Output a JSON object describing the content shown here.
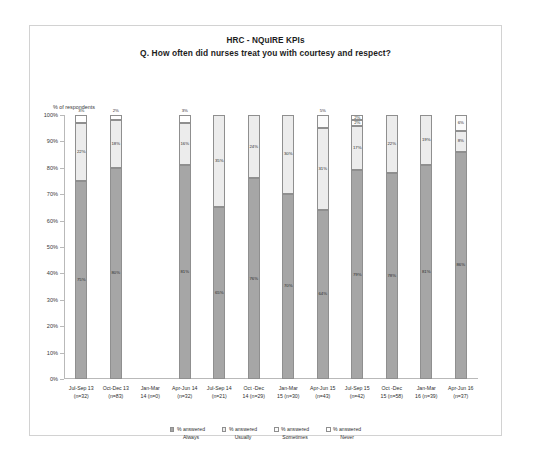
{
  "chart": {
    "title_line1": "HRC - NQuIRE KPIs",
    "title_line2": "Q. How often did nurses treat you with courtesy and respect?",
    "axis_title": "% of respondents"
  },
  "legend": {
    "items": [
      {
        "label_line1": "% answered",
        "label_line2": "Always",
        "key": "always",
        "color": "#a6a6a6"
      },
      {
        "label_line1": "% answered",
        "label_line2": "Usually",
        "key": "usually",
        "color": "#ececec"
      },
      {
        "label_line1": "% answered",
        "label_line2": "Sometimes",
        "key": "sometimes",
        "color": "#fbfbfb"
      },
      {
        "label_line1": "% answered",
        "label_line2": "Never",
        "key": "never",
        "color": "#ffffff"
      }
    ]
  },
  "chart_data": {
    "type": "bar",
    "subtype": "stacked-column-100",
    "xlabel": "",
    "ylabel": "% of respondents",
    "ylim": [
      0,
      100
    ],
    "ytick_labels": [
      "0%",
      "10%",
      "20%",
      "30%",
      "40%",
      "50%",
      "60%",
      "70%",
      "80%",
      "90%",
      "100%"
    ],
    "yticks": [
      0,
      10,
      20,
      30,
      40,
      50,
      60,
      70,
      80,
      90,
      100
    ],
    "grid": false,
    "legend_position": "bottom",
    "categories": [
      "Jul-Sep 13 (n=32)",
      "Oct-Dec 13 (n=83)",
      "Jan-Mar 14 (n=0)",
      "Apr-Jun 14 (n=32)",
      "Jul-Sep 14 (n=21)",
      "Oct -Dec 14 (n=29)",
      "Jan-Mar 15 (n=30)",
      "Apr-Jun 15 (n=43)",
      "Jul-Sep 15 (n=42)",
      "Oct -Dec 15 (n=58)",
      "Jan-Mar 16 (n=39)",
      "Apr-Jun 16 (n=37)"
    ],
    "category_labels": [
      [
        "Jul-Sep 13",
        "(n=32)"
      ],
      [
        "Oct-Dec 13",
        "(n=83)"
      ],
      [
        "Jan-Mar",
        "14 (n=0)"
      ],
      [
        "Apr-Jun 14",
        "(n=32)"
      ],
      [
        "Jul-Sep 14",
        "(n=21)"
      ],
      [
        "Oct -Dec",
        "14 (n=29)"
      ],
      [
        "Jan-Mar",
        "15 (n=30)"
      ],
      [
        "Apr-Jun 15",
        "(n=43)"
      ],
      [
        "Jul-Sep 15",
        "(n=42)"
      ],
      [
        "Oct -Dec",
        "15 (n=58)"
      ],
      [
        "Jan-Mar",
        "16 (n=39)"
      ],
      [
        "Apr-Jun 16",
        "(n=37)"
      ]
    ],
    "series": [
      {
        "name": "% answered Always",
        "key": "always",
        "values": [
          75,
          80,
          0,
          81,
          65,
          76,
          70,
          64,
          79,
          78,
          81,
          86
        ]
      },
      {
        "name": "% answered Usually",
        "key": "usually",
        "values": [
          22,
          18,
          0,
          16,
          35,
          24,
          30,
          31,
          17,
          22,
          19,
          8
        ]
      },
      {
        "name": "% answered Sometimes",
        "key": "sometimes",
        "values": [
          0,
          0,
          0,
          0,
          0,
          0,
          0,
          5,
          2,
          0,
          0,
          6
        ]
      },
      {
        "name": "% answered Never",
        "key": "never",
        "values": [
          3,
          2,
          0,
          3,
          0,
          0,
          0,
          0,
          2,
          0,
          0,
          0
        ]
      }
    ],
    "bars": [
      {
        "category": "Jul-Sep 13 (n=32)",
        "segments": [
          {
            "key": "always",
            "value": 75,
            "label": "75%",
            "label_placement": "inside"
          },
          {
            "key": "usually",
            "value": 22,
            "label": "22%",
            "label_placement": "inside"
          },
          {
            "key": "never",
            "value": 3,
            "label": "3%",
            "label_placement": "above"
          }
        ]
      },
      {
        "category": "Oct-Dec 13 (n=83)",
        "segments": [
          {
            "key": "always",
            "value": 80,
            "label": "80%",
            "label_placement": "inside"
          },
          {
            "key": "usually",
            "value": 18,
            "label": "18%",
            "label_placement": "inside"
          },
          {
            "key": "never",
            "value": 2,
            "label": "2%",
            "label_placement": "above"
          }
        ]
      },
      {
        "category": "Jan-Mar 14 (n=0)",
        "segments": []
      },
      {
        "category": "Apr-Jun 14 (n=32)",
        "segments": [
          {
            "key": "always",
            "value": 81,
            "label": "81%",
            "label_placement": "inside"
          },
          {
            "key": "usually",
            "value": 16,
            "label": "16%",
            "label_placement": "inside"
          },
          {
            "key": "never",
            "value": 3,
            "label": "3%",
            "label_placement": "above"
          }
        ]
      },
      {
        "category": "Jul-Sep 14 (n=21)",
        "segments": [
          {
            "key": "always",
            "value": 65,
            "label": "65%",
            "label_placement": "inside"
          },
          {
            "key": "usually",
            "value": 35,
            "label": "35%",
            "label_placement": "inside"
          }
        ]
      },
      {
        "category": "Oct -Dec 14 (n=29)",
        "segments": [
          {
            "key": "always",
            "value": 76,
            "label": "76%",
            "label_placement": "inside"
          },
          {
            "key": "usually",
            "value": 24,
            "label": "24%",
            "label_placement": "inside"
          }
        ]
      },
      {
        "category": "Jan-Mar 15 (n=30)",
        "segments": [
          {
            "key": "always",
            "value": 70,
            "label": "70%",
            "label_placement": "inside"
          },
          {
            "key": "usually",
            "value": 30,
            "label": "30%",
            "label_placement": "inside"
          }
        ]
      },
      {
        "category": "Apr-Jun 15 (n=43)",
        "segments": [
          {
            "key": "always",
            "value": 64,
            "label": "64%",
            "label_placement": "inside"
          },
          {
            "key": "usually",
            "value": 31,
            "label": "31%",
            "label_placement": "inside"
          },
          {
            "key": "sometimes",
            "value": 5,
            "label": "5%",
            "label_placement": "above"
          }
        ]
      },
      {
        "category": "Jul-Sep 15 (n=42)",
        "segments": [
          {
            "key": "always",
            "value": 79,
            "label": "79%",
            "label_placement": "inside"
          },
          {
            "key": "usually",
            "value": 17,
            "label": "17%",
            "label_placement": "inside"
          },
          {
            "key": "sometimes",
            "value": 2,
            "label": "2%",
            "label_placement": "inside"
          },
          {
            "key": "never",
            "value": 2,
            "label": "2%",
            "label_placement": "inside"
          }
        ]
      },
      {
        "category": "Oct -Dec 15 (n=58)",
        "segments": [
          {
            "key": "always",
            "value": 78,
            "label": "78%",
            "label_placement": "inside"
          },
          {
            "key": "usually",
            "value": 22,
            "label": "22%",
            "label_placement": "inside"
          }
        ]
      },
      {
        "category": "Jan-Mar 16 (n=39)",
        "segments": [
          {
            "key": "always",
            "value": 81,
            "label": "81%",
            "label_placement": "inside"
          },
          {
            "key": "usually",
            "value": 19,
            "label": "19%",
            "label_placement": "inside"
          }
        ]
      },
      {
        "category": "Apr-Jun 16 (n=37)",
        "segments": [
          {
            "key": "always",
            "value": 86,
            "label": "86%",
            "label_placement": "inside"
          },
          {
            "key": "usually",
            "value": 8,
            "label": "8%",
            "label_placement": "inside"
          },
          {
            "key": "sometimes",
            "value": 6,
            "label": "6%",
            "label_placement": "inside"
          }
        ]
      }
    ]
  }
}
